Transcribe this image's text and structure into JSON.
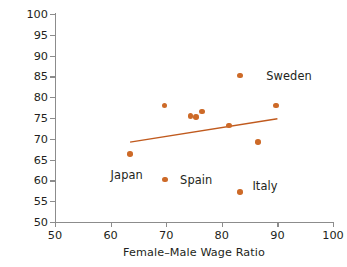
{
  "chart_data": {
    "type": "scatter",
    "title": "",
    "xlabel": "Female–Male Wage Ratio",
    "ylabel": "Participation Rate",
    "xlim": [
      50,
      100
    ],
    "ylim": [
      50,
      100
    ],
    "xticks": [
      50,
      60,
      70,
      80,
      90,
      100
    ],
    "yticks": [
      50,
      55,
      60,
      65,
      70,
      75,
      80,
      85,
      90,
      95,
      100
    ],
    "xtick_labels": [
      "50",
      "60",
      "70",
      "80",
      "90",
      "100"
    ],
    "ytick_labels": [
      "50",
      "55",
      "60",
      "65",
      "70",
      "75",
      "80",
      "85",
      "90",
      "95",
      "100"
    ],
    "grid": false,
    "legend": "none",
    "marker_color": "#cd6a28",
    "line_color": "#c05a1e",
    "axis_color": "#8c8c8c",
    "text_color": "#231f20",
    "points": [
      {
        "x": 63.5,
        "y": 66.3,
        "label": "Japan"
      },
      {
        "x": 69.7,
        "y": 78.0,
        "label": ""
      },
      {
        "x": 69.8,
        "y": 60.2,
        "label": "Spain"
      },
      {
        "x": 74.4,
        "y": 75.5,
        "label": ""
      },
      {
        "x": 75.4,
        "y": 75.3,
        "label": ""
      },
      {
        "x": 76.4,
        "y": 76.6,
        "label": ""
      },
      {
        "x": 81.3,
        "y": 73.2,
        "label": ""
      },
      {
        "x": 83.3,
        "y": 85.2,
        "label": "Sweden"
      },
      {
        "x": 83.3,
        "y": 57.2,
        "label": "Italy"
      },
      {
        "x": 86.5,
        "y": 69.2,
        "label": ""
      },
      {
        "x": 89.8,
        "y": 78.0,
        "label": ""
      }
    ],
    "trendline": {
      "x1": 63.5,
      "y1": 69.2,
      "x2": 90.0,
      "y2": 74.8
    },
    "annotations": [
      {
        "text": "Sweden",
        "x": 88.0,
        "y": 85.0,
        "anchor": "left"
      },
      {
        "text": "Japan",
        "x": 60.0,
        "y": 61.3,
        "anchor": "left"
      },
      {
        "text": "Spain",
        "x": 72.5,
        "y": 60.2,
        "anchor": "left"
      },
      {
        "text": "Italy",
        "x": 85.5,
        "y": 58.7,
        "anchor": "left"
      }
    ]
  }
}
